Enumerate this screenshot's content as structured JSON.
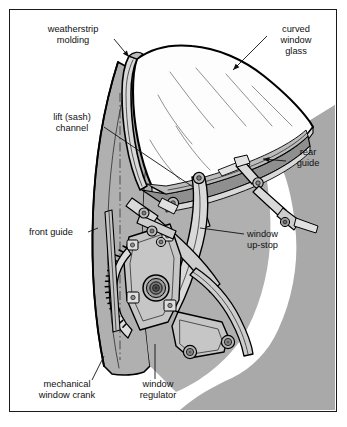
{
  "figure": {
    "colors": {
      "shadow_gray": "#a9a9a9",
      "panel_gray": "#b0b0b0",
      "part_light": "#d9d9d9",
      "part_mid": "#bcbcbc",
      "part_dark": "#8f8f8f",
      "glass_white": "#fdfdfd",
      "outline": "#000000",
      "text": "#111111",
      "frame_border": "#1a1a1a",
      "page_background": "#ffffff"
    },
    "labels": [
      {
        "id": "weatherstrip-molding",
        "lines": [
          "weatherstrip",
          "molding"
        ],
        "text_anchor": "middle",
        "x": 73,
        "y": 32,
        "line_height": 11,
        "leader": "M 114 39 L 129 57",
        "arrow": true,
        "arrow_at": [
          129,
          57
        ],
        "arrow_angle": 50
      },
      {
        "id": "curved-window-glass",
        "lines": [
          "curved",
          "window",
          "glass"
        ],
        "text_anchor": "middle",
        "x": 296,
        "y": 32,
        "line_height": 11,
        "leader": "M 267 36 L 233 70",
        "arrow": true,
        "arrow_at": [
          233,
          70
        ],
        "arrow_angle": 135
      },
      {
        "id": "lift-sash-channel",
        "lines": [
          "lift (sash)",
          "channel"
        ],
        "text_anchor": "middle",
        "x": 72,
        "y": 120,
        "line_height": 11,
        "leader": "M 104 127 L 193 187",
        "arrow": false
      },
      {
        "id": "rear-guide",
        "lines": [
          "rear",
          "guide"
        ],
        "text_anchor": "middle",
        "x": 308,
        "y": 155,
        "line_height": 11,
        "leader": "M 286 161 L 263 159",
        "arrow": true,
        "arrow_at": [
          263,
          159
        ],
        "arrow_angle": 185
      },
      {
        "id": "front-guide",
        "lines": [
          "front guide"
        ],
        "text_anchor": "start",
        "x": 29,
        "y": 235,
        "line_height": 11,
        "leader": "M 88 232 L 98 228",
        "arrow": false
      },
      {
        "id": "window-up-stop",
        "lines": [
          "window",
          "up-stop"
        ],
        "text_anchor": "start",
        "x": 247,
        "y": 237,
        "line_height": 11,
        "leader": "M 244 234 L 200 228",
        "arrow": false
      },
      {
        "id": "mechanical-window-crank",
        "lines": [
          "mechanical",
          "window crank"
        ],
        "text_anchor": "middle",
        "x": 67,
        "y": 387,
        "line_height": 11,
        "leader": "M 92 380 L 104 356",
        "arrow": false
      },
      {
        "id": "window-regulator",
        "lines": [
          "window",
          "regulator"
        ],
        "text_anchor": "middle",
        "x": 158,
        "y": 387,
        "line_height": 11,
        "leader": "M 155 379 L 155 344",
        "arrow": false
      }
    ]
  }
}
